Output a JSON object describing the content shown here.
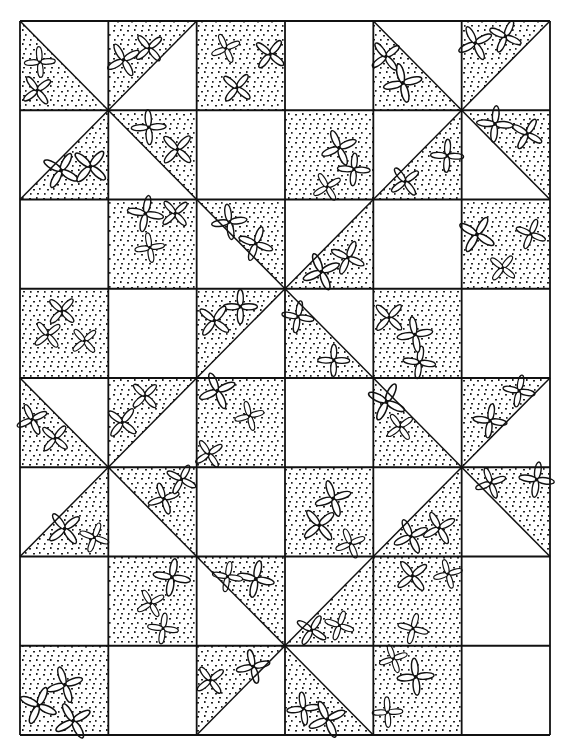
{
  "grid": {
    "cols": 6,
    "rows": 8,
    "left": 20,
    "top": 21,
    "right": 550,
    "bottom": 735
  },
  "colors": {
    "background": "#ffffff",
    "line": "#111111",
    "dots": "#222222"
  },
  "legend": {
    "F": "full patterned square",
    "E": "empty square",
    "LL": "diagonal \\ , patterned lower-left half",
    "UR": "diagonal \\ , patterned upper-right half",
    "UL": "diagonal / , patterned upper-left half",
    "LR": "diagonal / , patterned lower-right half"
  },
  "cells": [
    [
      "LL",
      "UL",
      "F",
      "E",
      "LL",
      "UL"
    ],
    [
      "LR",
      "UR",
      "E",
      "F",
      "LR",
      "UR"
    ],
    [
      "E",
      "F",
      "UR",
      "LR",
      "E",
      "F"
    ],
    [
      "F",
      "E",
      "UL",
      "LL",
      "F",
      "E"
    ],
    [
      "LL",
      "UL",
      "F",
      "E",
      "LL",
      "UL"
    ],
    [
      "LR",
      "UR",
      "E",
      "F",
      "LR",
      "UR"
    ],
    [
      "E",
      "F",
      "UR",
      "LR",
      "F",
      "E"
    ],
    [
      "F",
      "E",
      "UL",
      "LL",
      "F",
      "E"
    ]
  ]
}
